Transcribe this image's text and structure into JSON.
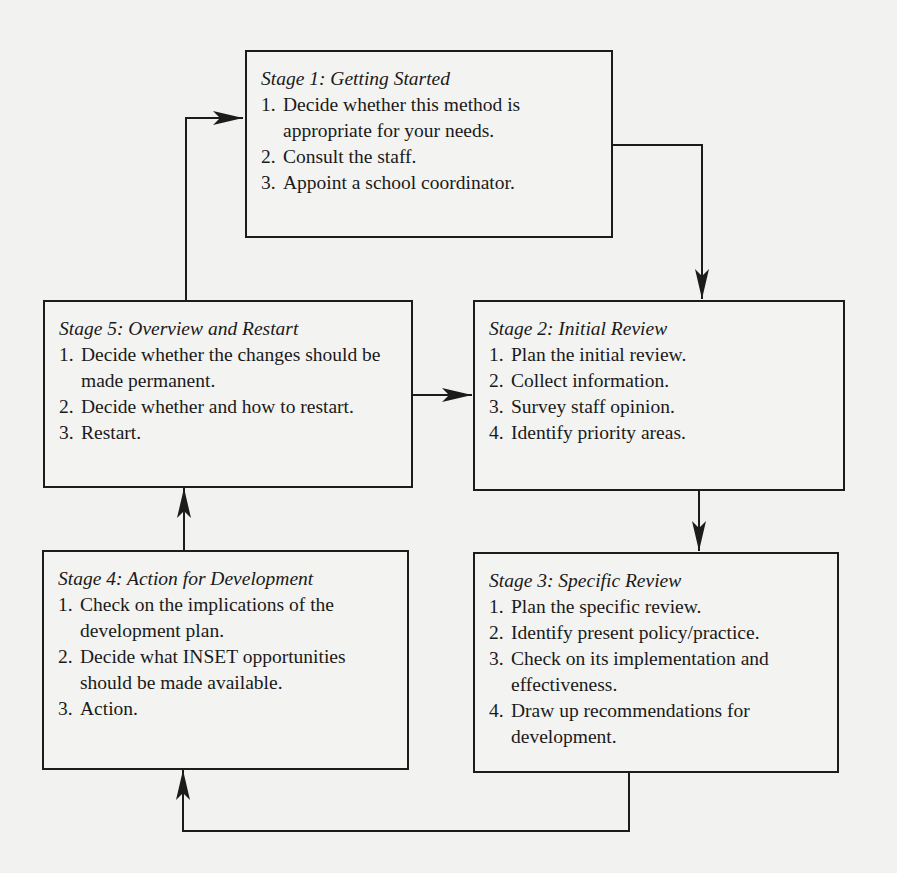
{
  "diagram": {
    "type": "cyclic flowchart",
    "stroke_color": "#1c1c1c",
    "background_color": "#f2f2f0",
    "stages": [
      {
        "id": "stage1",
        "title": "Stage 1: Getting Started",
        "items": [
          {
            "num": "1.",
            "text": "Decide whether this method is appropriate for your needs."
          },
          {
            "num": "2.",
            "text": "Consult the staff."
          },
          {
            "num": "3.",
            "text": "Appoint a school coordinator."
          }
        ]
      },
      {
        "id": "stage2",
        "title": "Stage 2: Initial Review",
        "items": [
          {
            "num": "1.",
            "text": "Plan the initial review."
          },
          {
            "num": "2.",
            "text": "Collect information."
          },
          {
            "num": "3.",
            "text": "Survey staff opinion."
          },
          {
            "num": "4.",
            "text": "Identify priority areas."
          }
        ]
      },
      {
        "id": "stage3",
        "title": "Stage 3: Specific Review",
        "items": [
          {
            "num": "1.",
            "text": "Plan the specific review."
          },
          {
            "num": "2.",
            "text": "Identify present policy/practice."
          },
          {
            "num": "3.",
            "text": "Check on its implementation and effectiveness."
          },
          {
            "num": "4.",
            "text": "Draw up recommendations for development."
          }
        ]
      },
      {
        "id": "stage4",
        "title": "Stage 4: Action for Development",
        "items": [
          {
            "num": "1.",
            "text": "Check on the implications of the development plan."
          },
          {
            "num": "2.",
            "text": "Decide what INSET opportunities should be made available."
          },
          {
            "num": "3.",
            "text": "Action."
          }
        ]
      },
      {
        "id": "stage5",
        "title": "Stage 5: Overview and Restart",
        "items": [
          {
            "num": "1.",
            "text": "Decide whether the changes should be made permanent."
          },
          {
            "num": "2.",
            "text": "Decide whether and how to restart."
          },
          {
            "num": "3.",
            "text": "Restart."
          }
        ]
      }
    ],
    "edges": [
      {
        "from": "stage1",
        "to": "stage2"
      },
      {
        "from": "stage2",
        "to": "stage3"
      },
      {
        "from": "stage3",
        "to": "stage4"
      },
      {
        "from": "stage4",
        "to": "stage5"
      },
      {
        "from": "stage5",
        "to": "stage1"
      },
      {
        "from": "stage5",
        "to": "stage2"
      }
    ]
  }
}
